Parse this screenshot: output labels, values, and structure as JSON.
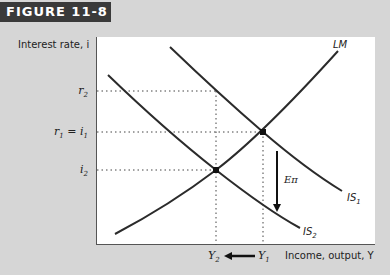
{
  "figure": {
    "label": "FIGURE 11-8"
  },
  "axes": {
    "ylabel": "Interest rate, i",
    "xlabel": "Income, output, Y",
    "yticks": {
      "r2": "r",
      "r2_sub": "2",
      "r1": "r",
      "r1_sub": "1",
      "eq": " = i",
      "i1_sub": "1",
      "i2": "i",
      "i2_sub": "2"
    },
    "xticks": {
      "y2": "Y",
      "y2_sub": "2",
      "y1": "Y",
      "y1_sub": "1"
    }
  },
  "curves": {
    "lm": "LM",
    "is1": "IS",
    "is1_sub": "1",
    "is2": "IS",
    "is2_sub": "2"
  },
  "annotation": {
    "shift": "Eπ"
  },
  "colors": {
    "curve": "#2b2b2b",
    "background": "#d6d6d6",
    "plot": "#ffffff",
    "tag": "#3a3a3a"
  }
}
